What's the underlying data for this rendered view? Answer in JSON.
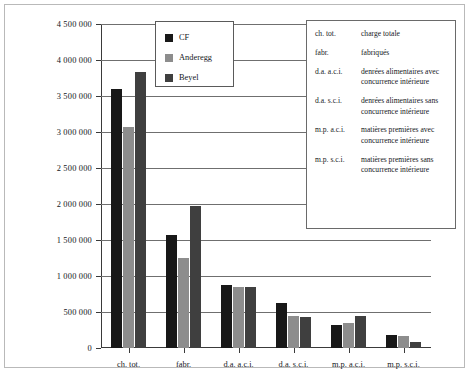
{
  "chart_data": {
    "type": "bar",
    "title": "",
    "xlabel": "",
    "ylabel": "",
    "ylim": [
      0,
      4500000
    ],
    "ytick_step": 500000,
    "grid": true,
    "legend_position": "top-center-inside",
    "ytick_labels": [
      "0",
      "500 000",
      "1 000 000",
      "1 500 000",
      "2 000 000",
      "2 500 000",
      "3 000 000",
      "3 500 000",
      "4 000 000",
      "4 500 000"
    ],
    "categories": [
      "ch. tot.",
      "fabr.",
      "d.a. a.c.i.",
      "d.a. s.c.i.",
      "m.p. a.c.i.",
      "m.p. s.c.i."
    ],
    "series": [
      {
        "name": "CF",
        "color": "#181818",
        "values": [
          3600000,
          1570000,
          880000,
          620000,
          320000,
          180000
        ]
      },
      {
        "name": "Anderegg",
        "color": "#8d8d8d",
        "values": [
          3070000,
          1250000,
          850000,
          450000,
          350000,
          160000
        ]
      },
      {
        "name": "Beyel",
        "color": "#3f3f3f",
        "values": [
          3840000,
          1970000,
          850000,
          430000,
          450000,
          80000
        ]
      }
    ]
  },
  "abbreviation_key": {
    "rows": [
      {
        "abbr": "ch. tot.",
        "full": "charge totale"
      },
      {
        "abbr": "fabr.",
        "full": "fabriqués"
      },
      {
        "abbr": "d.a. a.c.i.",
        "full": "denrées alimentaires avec concurrence intérieure"
      },
      {
        "abbr": "d.a. s.c.i.",
        "full": "denrées alimentaires sans concurrence intérieure"
      },
      {
        "abbr": "m.p. a.c.i.",
        "full": "matières premières avec concurrence intérieure"
      },
      {
        "abbr": "m.p. s.c.i.",
        "full": "matières premières sans concurrence intérieure"
      }
    ]
  }
}
